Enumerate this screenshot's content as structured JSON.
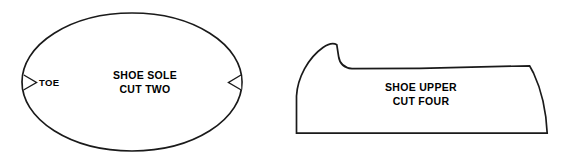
{
  "sheet": {
    "title": "Shoe Pattern Pieces",
    "background_color": "#ffffff",
    "line_color": "#1a1a1a",
    "text_color": "#000000"
  },
  "pieces": [
    {
      "id": "shoe-sole",
      "shape": "ellipse",
      "name_line_1": "SHOE SOLE",
      "name_line_2": "CUT TWO",
      "quantity_text": "CUT TWO",
      "notches": [
        {
          "id": "toe-notch",
          "label": "TOE",
          "side": "left",
          "direction": "right"
        },
        {
          "id": "heel-notch",
          "label": "",
          "side": "right",
          "direction": "left"
        }
      ]
    },
    {
      "id": "shoe-upper",
      "shape": "upper-profile",
      "name_line_1": "SHOE UPPER",
      "name_line_2": "CUT FOUR",
      "quantity_text": "CUT FOUR",
      "notches": []
    }
  ],
  "labels": {
    "sole_line_1": "SHOE SOLE",
    "sole_line_2": "CUT TWO",
    "upper_line_1": "SHOE UPPER",
    "upper_line_2": "CUT FOUR",
    "toe_marker": "TOE"
  }
}
